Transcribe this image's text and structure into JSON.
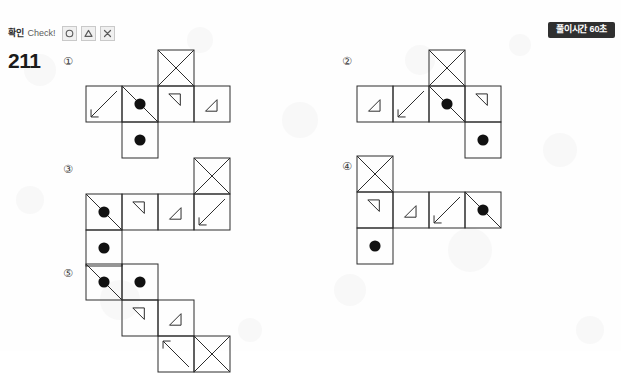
{
  "toolbar": {
    "check_label_ko": "확인",
    "check_label_en": "Check!",
    "buttons": [
      {
        "name": "circle-button",
        "icon": "circle-icon"
      },
      {
        "name": "triangle-button",
        "icon": "triangle-icon"
      },
      {
        "name": "close-button",
        "icon": "close-icon"
      }
    ]
  },
  "timer": {
    "label": "풀이시간 60초",
    "background": "#303030",
    "color": "#ffffff"
  },
  "question": {
    "number": "211"
  },
  "options": [
    {
      "id": "option-1",
      "marker": "①",
      "marker_x": 63,
      "marker_y": 56,
      "net_x": 85,
      "net_y": 49,
      "cell": 36,
      "cols": 4,
      "rows": 3,
      "cells": [
        {
          "col": 2,
          "row": 0,
          "glyphs": [
            "x-cross"
          ]
        },
        {
          "col": 0,
          "row": 1,
          "glyphs": [
            "arrow-dl"
          ]
        },
        {
          "col": 1,
          "row": 1,
          "glyphs": [
            "diag-tl-br",
            "dot-center"
          ]
        },
        {
          "col": 2,
          "row": 1,
          "glyphs": [
            "tri-small-tl"
          ]
        },
        {
          "col": 3,
          "row": 1,
          "glyphs": [
            "tri-small-br"
          ]
        },
        {
          "col": 1,
          "row": 2,
          "glyphs": [
            "dot-center"
          ]
        }
      ]
    },
    {
      "id": "option-2",
      "marker": "②",
      "marker_x": 342,
      "marker_y": 56,
      "net_x": 356,
      "net_y": 49,
      "cell": 36,
      "cols": 4,
      "rows": 3,
      "cells": [
        {
          "col": 2,
          "row": 0,
          "glyphs": [
            "x-cross"
          ]
        },
        {
          "col": 0,
          "row": 1,
          "glyphs": [
            "tri-small-br"
          ]
        },
        {
          "col": 1,
          "row": 1,
          "glyphs": [
            "arrow-dl"
          ]
        },
        {
          "col": 2,
          "row": 1,
          "glyphs": [
            "diag-tl-br",
            "dot-center"
          ]
        },
        {
          "col": 3,
          "row": 1,
          "glyphs": [
            "tri-small-tl"
          ]
        },
        {
          "col": 3,
          "row": 2,
          "glyphs": [
            "dot-center"
          ]
        }
      ]
    },
    {
      "id": "option-3",
      "marker": "③",
      "marker_x": 63,
      "marker_y": 164,
      "net_x": 85,
      "net_y": 157,
      "cell": 36,
      "cols": 4,
      "rows": 3,
      "cells": [
        {
          "col": 3,
          "row": 0,
          "glyphs": [
            "x-cross"
          ]
        },
        {
          "col": 0,
          "row": 1,
          "glyphs": [
            "diag-tl-br",
            "dot-center"
          ]
        },
        {
          "col": 1,
          "row": 1,
          "glyphs": [
            "tri-small-tl"
          ]
        },
        {
          "col": 2,
          "row": 1,
          "glyphs": [
            "tri-small-br"
          ]
        },
        {
          "col": 3,
          "row": 1,
          "glyphs": [
            "arrow-dl"
          ]
        },
        {
          "col": 0,
          "row": 2,
          "glyphs": [
            "dot-center"
          ]
        }
      ]
    },
    {
      "id": "option-4",
      "marker": "④",
      "marker_x": 342,
      "marker_y": 161,
      "net_x": 356,
      "net_y": 155,
      "cell": 36,
      "cols": 4,
      "rows": 3,
      "cells": [
        {
          "col": 0,
          "row": 0,
          "glyphs": [
            "x-cross"
          ]
        },
        {
          "col": 0,
          "row": 1,
          "glyphs": [
            "tri-small-tl"
          ]
        },
        {
          "col": 1,
          "row": 1,
          "glyphs": [
            "tri-small-br"
          ]
        },
        {
          "col": 2,
          "row": 1,
          "glyphs": [
            "arrow-dl"
          ]
        },
        {
          "col": 3,
          "row": 1,
          "glyphs": [
            "diag-tl-br",
            "dot-center"
          ]
        },
        {
          "col": 0,
          "row": 2,
          "glyphs": [
            "dot-center"
          ]
        }
      ]
    },
    {
      "id": "option-5",
      "marker": "⑤",
      "marker_x": 63,
      "marker_y": 268,
      "net_x": 85,
      "net_y": 263,
      "cell": 36,
      "cols": 5,
      "rows": 3,
      "cells": [
        {
          "col": 0,
          "row": 0,
          "glyphs": [
            "diag-tl-br",
            "dot-center"
          ]
        },
        {
          "col": 1,
          "row": 0,
          "glyphs": [
            "dot-center"
          ]
        },
        {
          "col": 1,
          "row": 1,
          "glyphs": [
            "tri-small-tl"
          ]
        },
        {
          "col": 2,
          "row": 1,
          "glyphs": [
            "tri-small-br"
          ]
        },
        {
          "col": 2,
          "row": 2,
          "glyphs": [
            "arrow-ul"
          ]
        },
        {
          "col": 3,
          "row": 2,
          "glyphs": [
            "x-cross"
          ]
        }
      ]
    }
  ],
  "style": {
    "line_color": "#2d2d2d",
    "dot_color": "#111111",
    "page_background": "#fefefe"
  }
}
